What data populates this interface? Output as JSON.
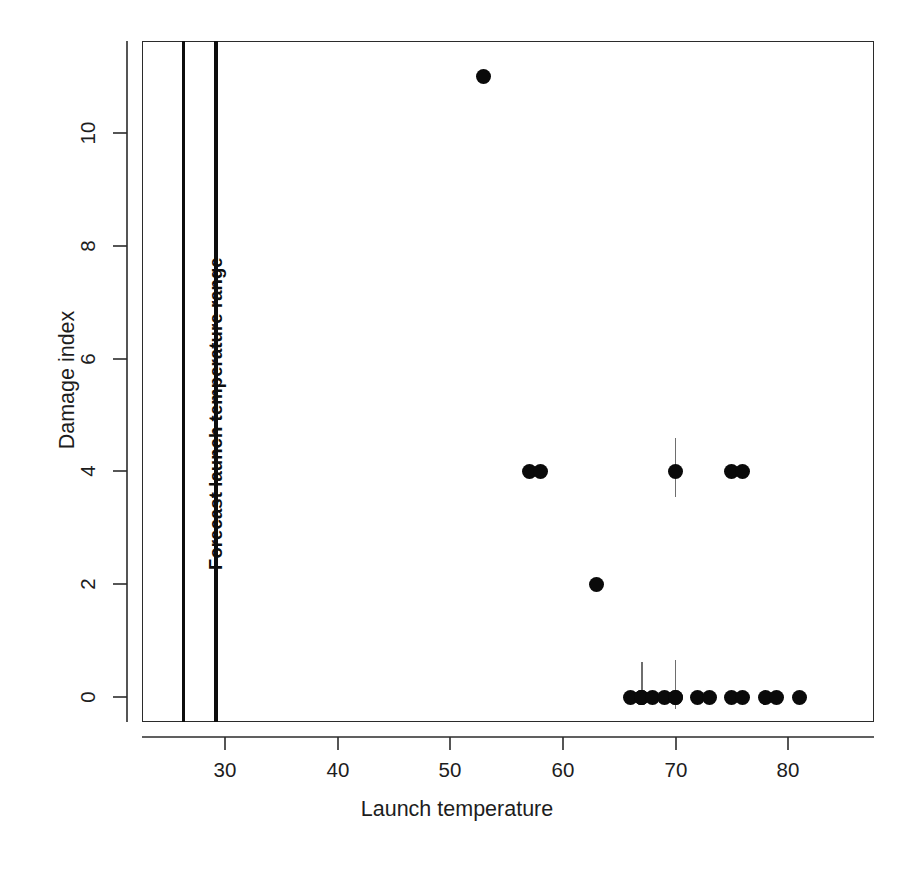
{
  "chart_data": {
    "type": "scatter",
    "title": "",
    "xlabel": "Launch temperature",
    "ylabel": "Damage index",
    "xlim": [
      23.5,
      88.5
    ],
    "ylim": [
      -0.9,
      11.9
    ],
    "xticks": [
      30,
      40,
      50,
      60,
      70,
      80
    ],
    "yticks": [
      0,
      2,
      4,
      6,
      8,
      10
    ],
    "grid": false,
    "legend": null,
    "points": [
      {
        "x": 53,
        "y": 11
      },
      {
        "x": 57,
        "y": 4
      },
      {
        "x": 58,
        "y": 4
      },
      {
        "x": 63,
        "y": 2
      },
      {
        "x": 66,
        "y": 0
      },
      {
        "x": 67,
        "y": 0
      },
      {
        "x": 67,
        "y": 0
      },
      {
        "x": 67,
        "y": 0
      },
      {
        "x": 68,
        "y": 0
      },
      {
        "x": 69,
        "y": 0
      },
      {
        "x": 70,
        "y": 0
      },
      {
        "x": 70,
        "y": 0
      },
      {
        "x": 70,
        "y": 4
      },
      {
        "x": 72,
        "y": 0
      },
      {
        "x": 73,
        "y": 0
      },
      {
        "x": 75,
        "y": 0
      },
      {
        "x": 75,
        "y": 4
      },
      {
        "x": 76,
        "y": 0
      },
      {
        "x": 76,
        "y": 4
      },
      {
        "x": 78,
        "y": 0
      },
      {
        "x": 79,
        "y": 0
      },
      {
        "x": 81,
        "y": 0
      }
    ],
    "jitter_bars": [
      {
        "x": 67,
        "y_low": 0,
        "y_high": 0.62
      },
      {
        "x": 70,
        "y_low": -0.22,
        "y_high": 0.66
      },
      {
        "x": 70,
        "y_low": 3.55,
        "y_high": 4.6
      }
    ],
    "annotations": [
      {
        "text": "Forecast launch temperature range",
        "type": "vertical-band",
        "x_min": 26.3,
        "x_max": 29.2,
        "orientation": "vertical",
        "bold": true
      }
    ]
  },
  "axes": {
    "x_title": "Launch temperature",
    "y_title": "Damage index",
    "x_tick_labels": [
      "30",
      "40",
      "50",
      "60",
      "70",
      "80"
    ],
    "y_tick_labels": [
      "0",
      "2",
      "4",
      "6",
      "8",
      "10"
    ]
  },
  "annotation": {
    "forecast_range_label": "Forecast launch temperature range"
  },
  "colors": {
    "point": "#0a0a0a",
    "axis": "#2b2b2b",
    "annotation_line": "#0d0d0d",
    "jitter_bar": "#6e6e6e",
    "background": "#ffffff",
    "text": "#1d1d1d"
  }
}
